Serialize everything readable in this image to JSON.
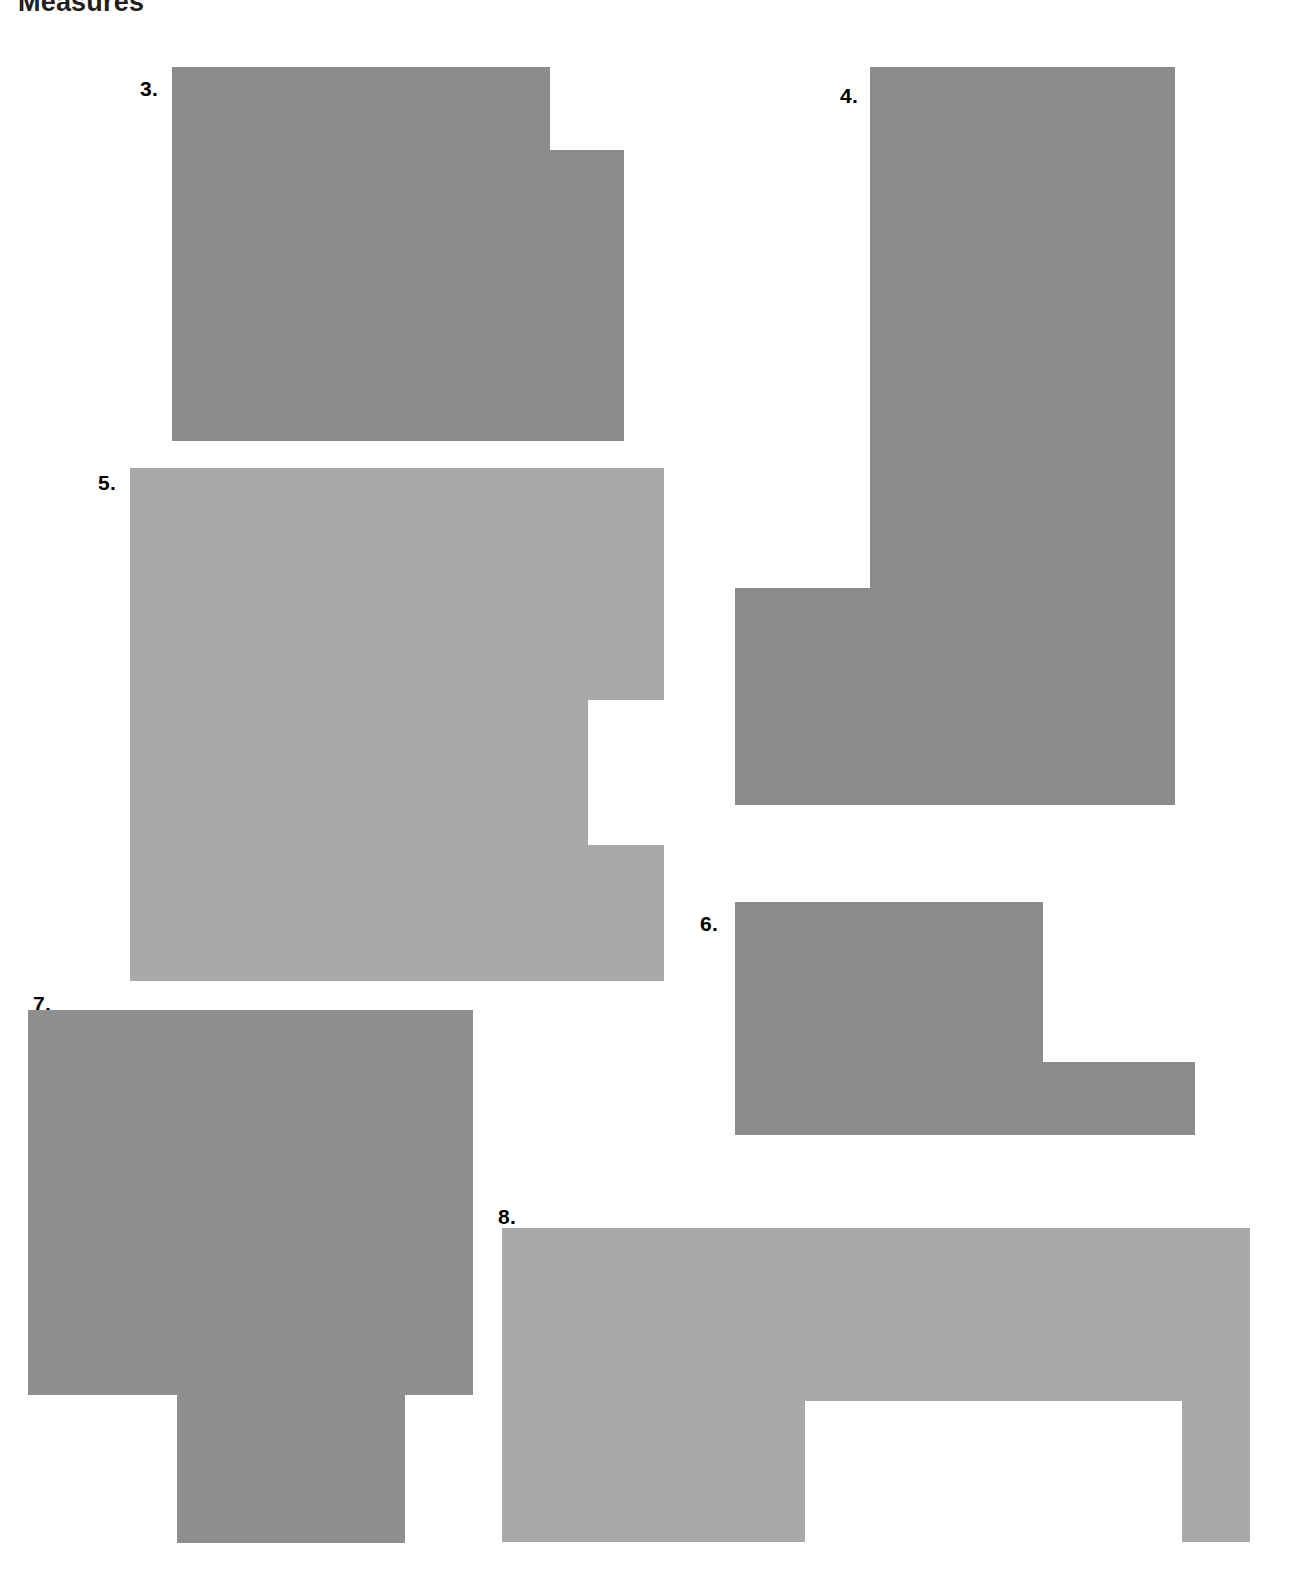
{
  "page": {
    "heading": "Measures",
    "background_color": "#ffffff",
    "width": 1306,
    "height": 1587
  },
  "figures": [
    {
      "label": "3.",
      "name": "shape-3",
      "description": "stepped rectangle with raised left block and lower right extension",
      "fill": "#8b8b8b",
      "label_x": 140,
      "label_y": 78,
      "x": 172,
      "y": 67,
      "width": 452,
      "height": 374,
      "polygon": "0,0 378,0 378,83 452,83 452,374 0,374"
    },
    {
      "label": "4.",
      "name": "shape-4",
      "description": "mirrored L shape, tall right column with foot extending left at the bottom",
      "fill": "#8b8b8b",
      "label_x": 840,
      "label_y": 85,
      "x": 870,
      "y": 67,
      "width": 305,
      "height": 738,
      "polygon": "0,0 305,0 305,738 -135,738 -135,521 0,521",
      "offset_left": -135
    },
    {
      "label": "5.",
      "name": "shape-5",
      "description": "large square with rectangular notch cut from the right edge",
      "fill": "#a9a9a9",
      "label_x": 98,
      "label_y": 472,
      "x": 130,
      "y": 468,
      "width": 534,
      "height": 513,
      "polygon": "0,0 534,0 534,232 458,232 458,377 534,377 534,513 0,513"
    },
    {
      "label": "6.",
      "name": "shape-6",
      "description": "stepped rectangle with lower right extension",
      "fill": "#8b8b8b",
      "label_x": 700,
      "label_y": 913,
      "x": 735,
      "y": 902,
      "width": 460,
      "height": 233,
      "polygon": "0,0 308,0 308,160 460,160 460,233 0,233"
    },
    {
      "label": "7.",
      "name": "shape-7",
      "description": "inverted T shape, wide body with centered foot below",
      "fill": "#8e8e8e",
      "label_x": 33,
      "label_y": 993,
      "x": 28,
      "y": 1010,
      "width": 445,
      "height": 533,
      "polygon": "0,0 445,0 445,385 377,385 377,533 149,533 149,385 0,385"
    },
    {
      "label": "8.",
      "name": "shape-8",
      "description": "inverted U arch shape, wide top bar with two legs and a rectangular gap between",
      "fill": "#a9a9a9",
      "label_x": 498,
      "label_y": 1206,
      "x": 502,
      "y": 1228,
      "width": 748,
      "height": 314,
      "polygon": "0,0 748,0 748,314 680,314 680,173 303,173 303,314 0,314"
    }
  ]
}
